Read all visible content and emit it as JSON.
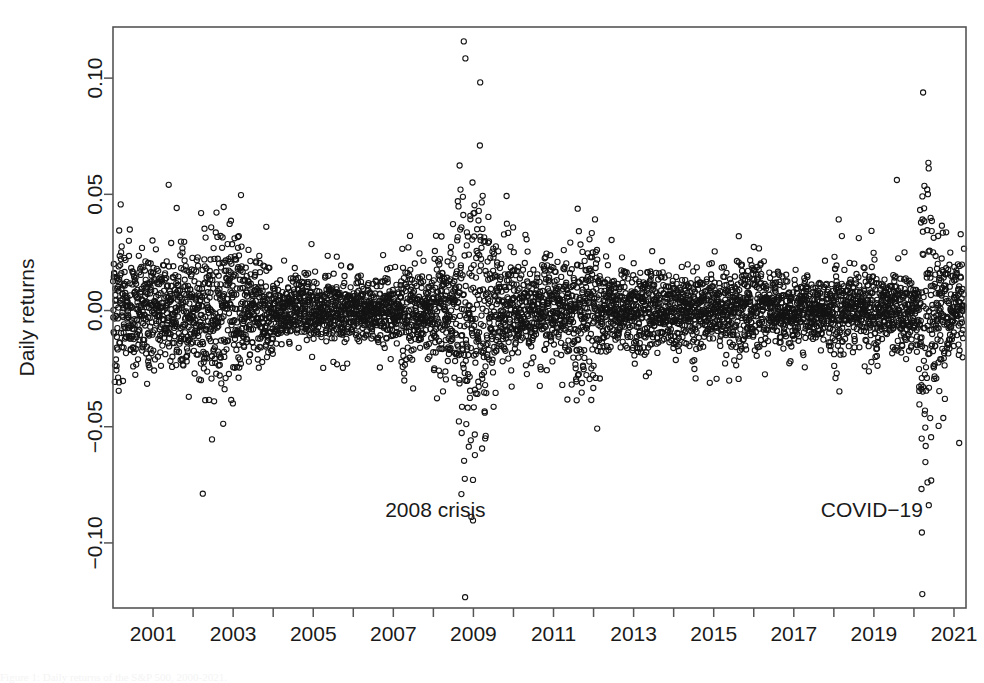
{
  "figure": {
    "background_color": "#ffffff",
    "foreground_color": "#1a1a1a",
    "marker_color": "#141414",
    "axis_color": "#555555",
    "cut_caption": "Figure 1: Daily returns of the S&P 500, 2000-2021."
  },
  "chart_data": {
    "type": "scatter",
    "title": "",
    "subtitle": "",
    "xlabel": "",
    "ylabel": "Daily returns",
    "xlim": [
      2000.0,
      2021.3
    ],
    "ylim": [
      -0.128,
      0.122
    ],
    "grid": false,
    "legend": null,
    "legend_position": "none",
    "marker": {
      "shape": "open-circle",
      "pch": 1,
      "radius_px": 2.6,
      "stroke_width": 1.1,
      "fill": "none"
    },
    "x_ticks": [
      2001,
      2002,
      2003,
      2004,
      2005,
      2006,
      2007,
      2008,
      2009,
      2010,
      2011,
      2012,
      2013,
      2014,
      2015,
      2016,
      2017,
      2018,
      2019,
      2020,
      2021
    ],
    "x_tick_labels": [
      "2001",
      "",
      "2003",
      "",
      "2005",
      "",
      "2007",
      "",
      "2009",
      "",
      "2011",
      "",
      "2013",
      "",
      "2015",
      "",
      "2017",
      "",
      "2019",
      "",
      "2021"
    ],
    "y_ticks": [
      -0.1,
      -0.05,
      0.0,
      0.05,
      0.1
    ],
    "y_tick_labels": [
      "-0.10",
      "-0.05",
      "0.00",
      "0.05",
      "0.10"
    ],
    "annotations": [
      {
        "text": "2008 crisis",
        "x": 2008.05,
        "y": -0.0855,
        "anchor": "middle"
      },
      {
        "text": "COVID-19",
        "x": 2018.95,
        "y": -0.0855,
        "anchor": "middle"
      }
    ],
    "n_points": 5300,
    "volatility_regimes": [
      {
        "start": 2000.0,
        "end": 2001.1,
        "sigma": 0.0135,
        "label": "dot-com unwind"
      },
      {
        "start": 2001.1,
        "end": 2001.75,
        "sigma": 0.012,
        "label": "early 2001"
      },
      {
        "start": 2001.75,
        "end": 2002.2,
        "sigma": 0.014,
        "label": "post 9/11"
      },
      {
        "start": 2002.2,
        "end": 2003.2,
        "sigma": 0.0165,
        "label": "2002 bear market"
      },
      {
        "start": 2003.2,
        "end": 2004.0,
        "sigma": 0.0105,
        "label": "recovery"
      },
      {
        "start": 2004.0,
        "end": 2007.2,
        "sigma": 0.0068,
        "label": "great moderation"
      },
      {
        "start": 2007.2,
        "end": 2008.0,
        "sigma": 0.0105,
        "label": "credit stress"
      },
      {
        "start": 2008.0,
        "end": 2008.6,
        "sigma": 0.0135,
        "label": "pre-Lehman"
      },
      {
        "start": 2008.6,
        "end": 2009.35,
        "sigma": 0.029,
        "label": "2008 crisis peak"
      },
      {
        "start": 2009.35,
        "end": 2010.0,
        "sigma": 0.0155,
        "label": "crisis tail"
      },
      {
        "start": 2010.0,
        "end": 2011.55,
        "sigma": 0.0105,
        "label": "post-crisis"
      },
      {
        "start": 2011.55,
        "end": 2012.1,
        "sigma": 0.0185,
        "label": "euro crisis"
      },
      {
        "start": 2012.1,
        "end": 2015.5,
        "sigma": 0.008,
        "label": "calm"
      },
      {
        "start": 2015.5,
        "end": 2016.3,
        "sigma": 0.011,
        "label": "china selloff"
      },
      {
        "start": 2016.3,
        "end": 2018.0,
        "sigma": 0.007,
        "label": "low vol"
      },
      {
        "start": 2018.0,
        "end": 2018.25,
        "sigma": 0.013,
        "label": "volmageddon"
      },
      {
        "start": 2018.25,
        "end": 2018.9,
        "sigma": 0.0085,
        "label": "mid 2018"
      },
      {
        "start": 2018.9,
        "end": 2019.1,
        "sigma": 0.0125,
        "label": "q4 2018"
      },
      {
        "start": 2019.1,
        "end": 2020.12,
        "sigma": 0.008,
        "label": "2019 calm"
      },
      {
        "start": 2020.12,
        "end": 2020.45,
        "sigma": 0.033,
        "label": "COVID-19 crash"
      },
      {
        "start": 2020.45,
        "end": 2020.8,
        "sigma": 0.016,
        "label": "COVID recovery"
      },
      {
        "start": 2020.8,
        "end": 2021.25,
        "sigma": 0.0105,
        "label": "late 2020"
      }
    ],
    "notable_extremes": [
      {
        "x": 2008.76,
        "y": 0.1158,
        "label": "largest positive return"
      },
      {
        "x": 2008.8,
        "y": 0.1085,
        "label": "second largest positive"
      },
      {
        "x": 2020.23,
        "y": 0.0938,
        "label": "COVID rebound high"
      },
      {
        "x": 2020.21,
        "y": -0.122,
        "label": "largest negative return"
      },
      {
        "x": 2020.2,
        "y": -0.0955,
        "label": "COVID crash low"
      },
      {
        "x": 2020.19,
        "y": -0.0768,
        "label": "COVID crash low 2"
      },
      {
        "x": 2008.99,
        "y": -0.0903,
        "label": "2008 crash low"
      },
      {
        "x": 2008.95,
        "y": -0.0888,
        "label": "2008 crash low 2"
      },
      {
        "x": 2008.7,
        "y": -0.079,
        "label": "2008 crash low 3"
      }
    ]
  }
}
